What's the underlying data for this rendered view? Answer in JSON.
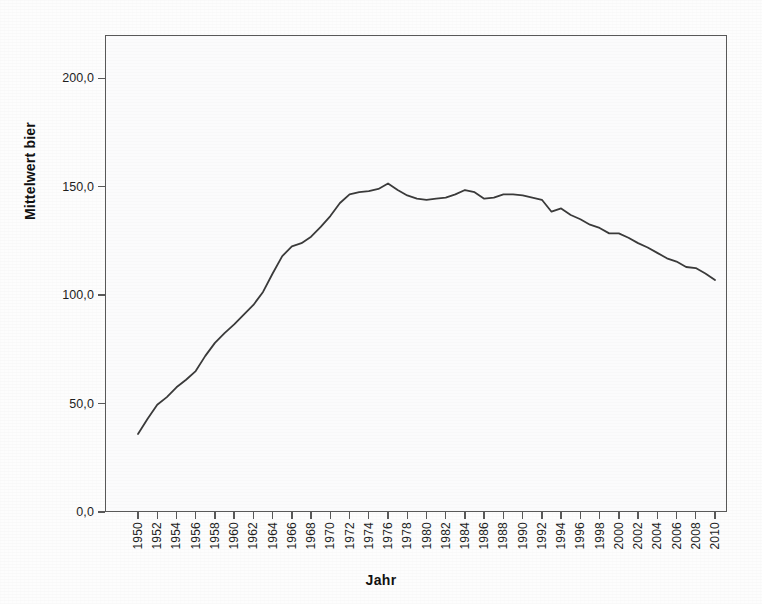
{
  "chart_data": {
    "type": "line",
    "title": "",
    "xlabel": "Jahr",
    "ylabel": "Mittelwert bier",
    "xlim": [
      1950,
      2010
    ],
    "ylim": [
      0,
      220
    ],
    "y_ticks": [
      "0,0",
      "50,0",
      "100,0",
      "150,0",
      "200,0"
    ],
    "y_tick_values": [
      0,
      50,
      100,
      150,
      200
    ],
    "x_ticks": [
      "1950",
      "1952",
      "1954",
      "1956",
      "1958",
      "1960",
      "1962",
      "1964",
      "1966",
      "1968",
      "1970",
      "1972",
      "1974",
      "1976",
      "1978",
      "1980",
      "1982",
      "1984",
      "1986",
      "1988",
      "1990",
      "1992",
      "1994",
      "1996",
      "1998",
      "2000",
      "2002",
      "2004",
      "2006",
      "2008",
      "2010"
    ],
    "x_tick_values": [
      1950,
      1952,
      1954,
      1956,
      1958,
      1960,
      1962,
      1964,
      1966,
      1968,
      1970,
      1972,
      1974,
      1976,
      1978,
      1980,
      1982,
      1984,
      1986,
      1988,
      1990,
      1992,
      1994,
      1996,
      1998,
      2000,
      2002,
      2004,
      2006,
      2008,
      2010
    ],
    "grid": false,
    "legend": "none",
    "line_color": "#3a3a3a",
    "series": [
      {
        "name": "Mittelwert bier",
        "x": [
          1950,
          1951,
          1952,
          1953,
          1954,
          1955,
          1956,
          1957,
          1958,
          1959,
          1960,
          1961,
          1962,
          1963,
          1964,
          1965,
          1966,
          1967,
          1968,
          1969,
          1970,
          1971,
          1972,
          1973,
          1974,
          1975,
          1976,
          1977,
          1978,
          1979,
          1980,
          1981,
          1982,
          1983,
          1984,
          1985,
          1986,
          1987,
          1988,
          1989,
          1990,
          1991,
          1992,
          1993,
          1994,
          1995,
          1996,
          1997,
          1998,
          1999,
          2000,
          2001,
          2002,
          2003,
          2004,
          2005,
          2006,
          2007,
          2008,
          2009,
          2010
        ],
        "values": [
          36.0,
          43.0,
          49.5,
          53.0,
          57.5,
          61.0,
          65.0,
          72.0,
          78.0,
          82.5,
          86.5,
          91.0,
          95.5,
          101.5,
          110.0,
          118.0,
          122.5,
          124.0,
          127.0,
          131.5,
          136.5,
          142.5,
          146.5,
          147.5,
          148.0,
          149.0,
          151.5,
          148.5,
          146.0,
          144.5,
          144.0,
          144.5,
          145.0,
          146.5,
          148.5,
          147.5,
          144.5,
          145.0,
          146.5,
          146.5,
          146.0,
          145.0,
          144.0,
          138.5,
          140.0,
          137.0,
          135.0,
          132.5,
          131.0,
          128.5,
          128.5,
          126.5,
          124.0,
          122.0,
          119.5,
          117.0,
          115.5,
          113.0,
          112.5,
          110.0,
          107.0
        ]
      }
    ]
  }
}
